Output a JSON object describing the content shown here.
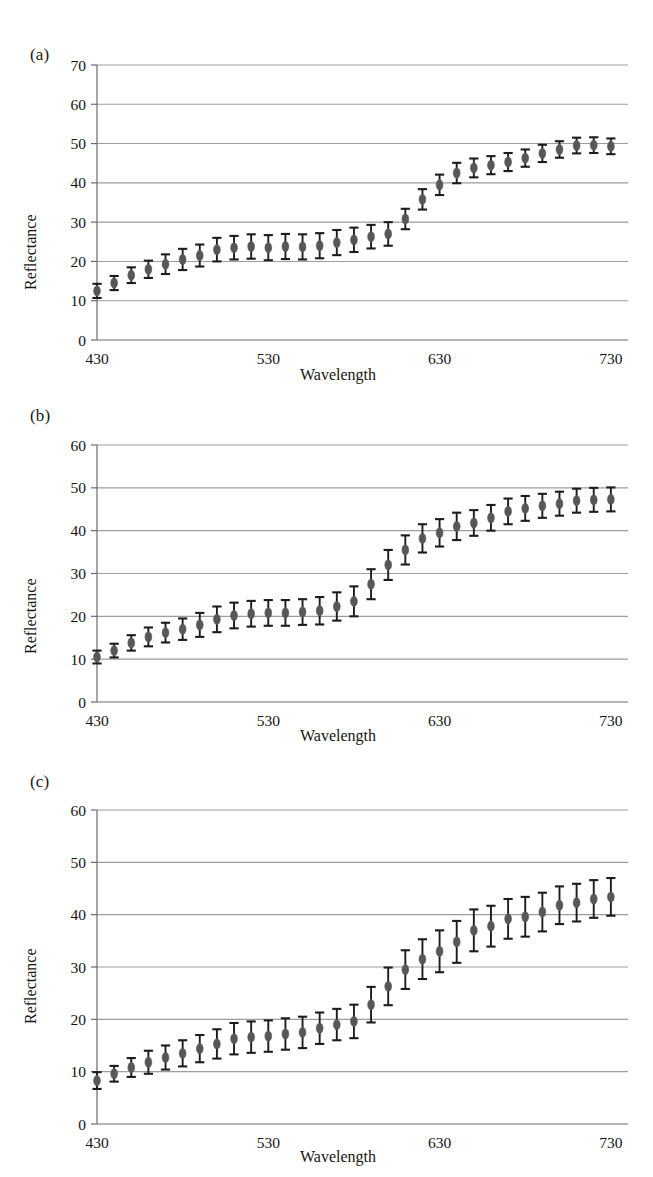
{
  "figure": {
    "panels": [
      {
        "key": "a",
        "label": "(a)",
        "xlabel": "Wavelength",
        "ylabel": "Reflectance"
      },
      {
        "key": "b",
        "label": "(b)",
        "xlabel": "Wavelength",
        "ylabel": "Reflectance"
      },
      {
        "key": "c",
        "label": "(c)",
        "xlabel": "Wavelength",
        "ylabel": "Reflectance"
      }
    ],
    "marker_color": "#575757",
    "errorbar_color": "#1c1c1c",
    "gridline_color": "#8d8d8d",
    "axis_color": "#6b6b6b"
  },
  "chart_data": [
    {
      "type": "scatter",
      "panel": "a",
      "title": "(a)",
      "xlabel": "Wavelength",
      "ylabel": "Reflectance",
      "xlim": [
        430,
        740
      ],
      "ylim": [
        0,
        70
      ],
      "xticks": [
        430,
        530,
        630,
        730
      ],
      "yticks": [
        0,
        10,
        20,
        30,
        40,
        50,
        60,
        70
      ],
      "xtick_labels": [
        "430",
        "530",
        "630",
        "730"
      ],
      "ytick_labels": [
        "0",
        "10",
        "20",
        "30",
        "40",
        "50",
        "60",
        "70"
      ],
      "grid": true,
      "legend": "none",
      "x": [
        430,
        440,
        450,
        460,
        470,
        480,
        490,
        500,
        510,
        520,
        530,
        540,
        550,
        560,
        570,
        580,
        590,
        600,
        610,
        620,
        630,
        640,
        650,
        660,
        670,
        680,
        690,
        700,
        710,
        720,
        730
      ],
      "values": [
        12.5,
        14.5,
        16.5,
        18.0,
        19.3,
        20.5,
        21.5,
        23.0,
        23.5,
        23.8,
        23.5,
        23.8,
        23.7,
        24.0,
        24.8,
        25.5,
        26.3,
        27.0,
        30.8,
        35.8,
        39.5,
        42.5,
        43.8,
        44.5,
        45.3,
        46.3,
        47.5,
        48.5,
        49.5,
        49.6,
        49.3
      ],
      "yerr": [
        1.8,
        1.8,
        2.0,
        2.2,
        2.5,
        2.7,
        2.8,
        3.0,
        3.0,
        3.1,
        3.2,
        3.2,
        3.2,
        3.2,
        3.2,
        3.1,
        3.0,
        3.0,
        2.6,
        2.6,
        2.6,
        2.6,
        2.4,
        2.3,
        2.3,
        2.2,
        2.2,
        2.1,
        2.0,
        2.0,
        2.0
      ]
    },
    {
      "type": "scatter",
      "panel": "b",
      "title": "(b)",
      "xlabel": "Wavelength",
      "ylabel": "Reflectance",
      "xlim": [
        430,
        740
      ],
      "ylim": [
        0,
        60
      ],
      "xticks": [
        430,
        530,
        630,
        730
      ],
      "yticks": [
        0,
        10,
        20,
        30,
        40,
        50,
        60
      ],
      "xtick_labels": [
        "430",
        "530",
        "630",
        "730"
      ],
      "ytick_labels": [
        "0",
        "10",
        "20",
        "30",
        "40",
        "50",
        "60"
      ],
      "grid": true,
      "legend": "none",
      "x": [
        430,
        440,
        450,
        460,
        470,
        480,
        490,
        500,
        510,
        520,
        530,
        540,
        550,
        560,
        570,
        580,
        590,
        600,
        610,
        620,
        630,
        640,
        650,
        660,
        670,
        680,
        690,
        700,
        710,
        720,
        730
      ],
      "values": [
        10.5,
        12.0,
        13.8,
        15.2,
        16.2,
        17.0,
        18.0,
        19.3,
        20.2,
        20.6,
        20.8,
        20.8,
        21.0,
        21.3,
        22.3,
        23.5,
        27.5,
        32.0,
        35.5,
        38.2,
        39.5,
        41.0,
        41.8,
        43.0,
        44.5,
        45.2,
        45.8,
        46.3,
        47.0,
        47.2,
        47.3
      ],
      "yerr": [
        1.5,
        1.6,
        1.8,
        2.2,
        2.3,
        2.5,
        2.8,
        3.0,
        3.0,
        3.0,
        3.0,
        3.0,
        3.0,
        3.2,
        3.3,
        3.5,
        3.5,
        3.5,
        3.4,
        3.3,
        3.2,
        3.2,
        3.0,
        3.0,
        3.0,
        2.9,
        2.8,
        2.8,
        2.8,
        2.8,
        2.8
      ]
    },
    {
      "type": "scatter",
      "panel": "c",
      "title": "(c)",
      "xlabel": "Wavelength",
      "ylabel": "Reflectance",
      "xlim": [
        430,
        740
      ],
      "ylim": [
        0,
        60
      ],
      "xticks": [
        430,
        530,
        630,
        730
      ],
      "yticks": [
        0,
        10,
        20,
        30,
        40,
        50,
        60
      ],
      "xtick_labels": [
        "430",
        "530",
        "630",
        "730"
      ],
      "ytick_labels": [
        "0",
        "10",
        "20",
        "30",
        "40",
        "50",
        "60"
      ],
      "grid": true,
      "legend": "none",
      "x": [
        430,
        440,
        450,
        460,
        470,
        480,
        490,
        500,
        510,
        520,
        530,
        540,
        550,
        560,
        570,
        580,
        590,
        600,
        610,
        620,
        630,
        640,
        650,
        660,
        670,
        680,
        690,
        700,
        710,
        720,
        730
      ],
      "values": [
        8.3,
        9.6,
        10.8,
        11.8,
        12.7,
        13.5,
        14.4,
        15.3,
        16.3,
        16.6,
        16.8,
        17.2,
        17.5,
        18.3,
        19.0,
        19.6,
        22.8,
        26.3,
        29.5,
        31.5,
        33.0,
        34.8,
        37.0,
        37.8,
        39.2,
        39.6,
        40.5,
        41.8,
        42.3,
        43.0,
        43.4
      ],
      "yerr": [
        1.6,
        1.5,
        1.8,
        2.2,
        2.3,
        2.5,
        2.6,
        2.8,
        3.0,
        3.0,
        3.0,
        3.0,
        3.0,
        3.0,
        3.0,
        3.2,
        3.4,
        3.6,
        3.7,
        3.8,
        4.0,
        4.0,
        4.0,
        3.9,
        3.8,
        3.8,
        3.7,
        3.6,
        3.6,
        3.6,
        3.6
      ]
    }
  ]
}
